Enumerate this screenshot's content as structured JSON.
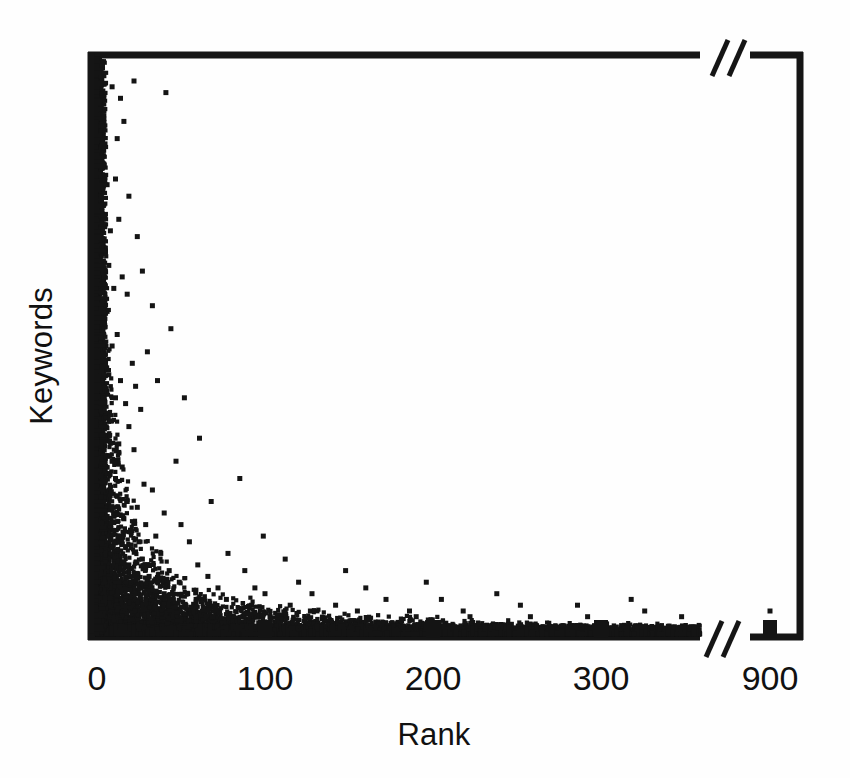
{
  "figure": {
    "title": "",
    "background_color": "#fefefe",
    "ink_color": "#141414"
  },
  "axes": {
    "x_label": "Rank",
    "y_label": "Keywords",
    "x_tick_labels": [
      "0",
      "100",
      "200",
      "300",
      "900"
    ],
    "y_tick_labels": [],
    "break_marker": "//",
    "break_marker_count": 2
  },
  "chart_data": {
    "type": "scatter",
    "title": "",
    "xlabel": "Rank",
    "ylabel": "Keywords",
    "xlim": [
      0,
      360
    ],
    "ylim": [
      0,
      100
    ],
    "xticks": [
      0,
      100,
      200,
      300,
      900
    ],
    "xticklabels": [
      "0",
      "100",
      "200",
      "300",
      "900"
    ],
    "yticks": [],
    "yticklabels": [],
    "grid": false,
    "legend": null,
    "axis_break": {
      "axis": "x",
      "from": 360,
      "to": 880,
      "marker": "//"
    },
    "marker": {
      "shape": "square",
      "size_px": 5,
      "color": "#141414"
    },
    "points": [
      [
        2,
        97
      ],
      [
        3,
        92
      ],
      [
        1,
        88
      ],
      [
        4,
        84
      ],
      [
        2,
        80
      ],
      [
        6,
        78
      ],
      [
        3,
        74
      ],
      [
        9,
        95
      ],
      [
        14,
        93
      ],
      [
        16,
        89
      ],
      [
        12,
        86
      ],
      [
        22,
        96
      ],
      [
        41,
        94
      ],
      [
        11,
        79
      ],
      [
        13,
        72
      ],
      [
        8,
        70
      ],
      [
        19,
        76
      ],
      [
        5,
        67
      ],
      [
        7,
        64
      ],
      [
        15,
        62
      ],
      [
        24,
        69
      ],
      [
        10,
        60
      ],
      [
        3,
        58
      ],
      [
        6,
        56
      ],
      [
        18,
        59
      ],
      [
        2,
        54
      ],
      [
        12,
        52
      ],
      [
        9,
        50
      ],
      [
        27,
        63
      ],
      [
        33,
        57
      ],
      [
        4,
        48
      ],
      [
        1,
        46
      ],
      [
        7,
        45
      ],
      [
        14,
        44
      ],
      [
        21,
        47
      ],
      [
        5,
        42
      ],
      [
        11,
        41
      ],
      [
        17,
        40
      ],
      [
        3,
        38
      ],
      [
        8,
        37
      ],
      [
        23,
        43
      ],
      [
        30,
        49
      ],
      [
        2,
        35
      ],
      [
        6,
        34
      ],
      [
        13,
        33
      ],
      [
        19,
        36
      ],
      [
        26,
        39
      ],
      [
        44,
        53
      ],
      [
        1,
        31
      ],
      [
        9,
        30
      ],
      [
        15,
        29
      ],
      [
        4,
        28
      ],
      [
        11,
        27
      ],
      [
        22,
        32
      ],
      [
        36,
        44
      ],
      [
        52,
        41
      ],
      [
        2,
        26
      ],
      [
        7,
        25
      ],
      [
        12,
        24
      ],
      [
        18,
        23
      ],
      [
        28,
        26
      ],
      [
        5,
        22
      ],
      [
        10,
        21
      ],
      [
        16,
        20
      ],
      [
        24,
        22
      ],
      [
        33,
        25
      ],
      [
        47,
        30
      ],
      [
        61,
        34
      ],
      [
        3,
        19
      ],
      [
        8,
        18
      ],
      [
        14,
        17
      ],
      [
        20,
        18
      ],
      [
        29,
        19
      ],
      [
        40,
        21
      ],
      [
        1,
        16
      ],
      [
        6,
        15
      ],
      [
        11,
        14
      ],
      [
        17,
        15
      ],
      [
        25,
        16
      ],
      [
        35,
        17
      ],
      [
        50,
        19
      ],
      [
        68,
        23
      ],
      [
        85,
        27
      ],
      [
        2,
        13
      ],
      [
        7,
        12
      ],
      [
        13,
        11
      ],
      [
        19,
        12
      ],
      [
        27,
        13
      ],
      [
        38,
        14
      ],
      [
        55,
        16
      ],
      [
        4,
        10
      ],
      [
        9,
        9
      ],
      [
        15,
        9
      ],
      [
        22,
        10
      ],
      [
        31,
        10
      ],
      [
        43,
        11
      ],
      [
        60,
        12
      ],
      [
        78,
        14
      ],
      [
        99,
        17
      ],
      [
        1,
        8
      ],
      [
        6,
        7
      ],
      [
        12,
        7
      ],
      [
        18,
        8
      ],
      [
        26,
        8
      ],
      [
        36,
        9
      ],
      [
        49,
        9
      ],
      [
        66,
        10
      ],
      [
        88,
        11
      ],
      [
        112,
        13
      ],
      [
        3,
        6
      ],
      [
        8,
        6
      ],
      [
        14,
        5
      ],
      [
        21,
        6
      ],
      [
        29,
        6
      ],
      [
        40,
        7
      ],
      [
        54,
        7
      ],
      [
        72,
        8
      ],
      [
        94,
        8
      ],
      [
        120,
        9
      ],
      [
        148,
        11
      ],
      [
        2,
        5
      ],
      [
        7,
        4
      ],
      [
        11,
        4
      ],
      [
        17,
        4
      ],
      [
        24,
        5
      ],
      [
        33,
        5
      ],
      [
        45,
        5
      ],
      [
        59,
        6
      ],
      [
        77,
        6
      ],
      [
        100,
        7
      ],
      [
        128,
        7
      ],
      [
        160,
        8
      ],
      [
        196,
        9
      ],
      [
        5,
        3
      ],
      [
        10,
        3
      ],
      [
        16,
        3
      ],
      [
        23,
        3
      ],
      [
        31,
        4
      ],
      [
        42,
        4
      ],
      [
        56,
        4
      ],
      [
        73,
        4
      ],
      [
        92,
        5
      ],
      [
        115,
        5
      ],
      [
        142,
        5
      ],
      [
        172,
        6
      ],
      [
        205,
        6
      ],
      [
        238,
        7
      ],
      [
        4,
        2
      ],
      [
        9,
        2
      ],
      [
        15,
        2
      ],
      [
        20,
        2
      ],
      [
        28,
        2
      ],
      [
        37,
        3
      ],
      [
        48,
        3
      ],
      [
        63,
        3
      ],
      [
        81,
        3
      ],
      [
        103,
        3
      ],
      [
        127,
        4
      ],
      [
        155,
        4
      ],
      [
        186,
        4
      ],
      [
        218,
        4
      ],
      [
        252,
        5
      ],
      [
        286,
        5
      ],
      [
        318,
        6
      ],
      [
        1,
        1
      ],
      [
        6,
        1
      ],
      [
        13,
        1
      ],
      [
        19,
        1
      ],
      [
        26,
        1
      ],
      [
        34,
        1
      ],
      [
        44,
        2
      ],
      [
        57,
        2
      ],
      [
        70,
        2
      ],
      [
        86,
        2
      ],
      [
        106,
        2
      ],
      [
        130,
        2
      ],
      [
        158,
        2
      ],
      [
        190,
        3
      ],
      [
        222,
        3
      ],
      [
        258,
        3
      ],
      [
        292,
        3
      ],
      [
        326,
        4
      ],
      [
        348,
        3
      ],
      [
        900,
        4
      ]
    ],
    "highlight_bars": [
      {
        "x": 100,
        "height": 14
      },
      {
        "x": 200,
        "height": 14
      },
      {
        "x": 300,
        "height": 14
      },
      {
        "x": 900,
        "height": 14
      }
    ]
  }
}
